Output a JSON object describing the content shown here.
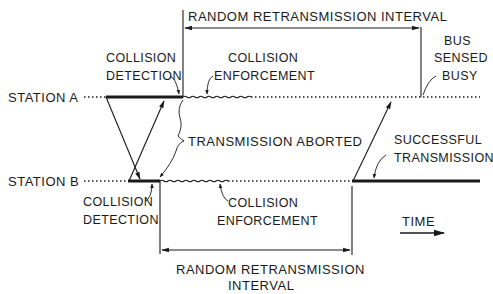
{
  "diagram": {
    "stations": [
      {
        "id": "A",
        "label": "STATION A"
      },
      {
        "id": "B",
        "label": "STATION B"
      }
    ],
    "labels": {
      "top_interval": "RANDOM RETRANSMISSION INTERVAL",
      "collision_detection_a_line1": "COLLISION",
      "collision_detection_a_line2": "DETECTION",
      "collision_enforcement_a_line1": "COLLISION",
      "collision_enforcement_a_line2": "ENFORCEMENT",
      "bus_sensed_busy_line1": "BUS",
      "bus_sensed_busy_line2": "SENSED",
      "bus_sensed_busy_line3": "BUSY",
      "transmission_aborted": "TRANSMISSION ABORTED",
      "successful_transmission_line1": "SUCCESSFUL",
      "successful_transmission_line2": "TRANSMISSION",
      "collision_detection_b_line1": "COLLISION",
      "collision_detection_b_line2": "DETECTION",
      "collision_enforcement_b_line1": "COLLISION",
      "collision_enforcement_b_line2": "ENFORCEMENT",
      "time": "TIME",
      "bottom_interval_line1": "RANDOM  RETRANSMISSION",
      "bottom_interval_line2": "INTERVAL"
    },
    "colors": {
      "ink": "#1a1a1a",
      "background": "#ffffff"
    }
  }
}
